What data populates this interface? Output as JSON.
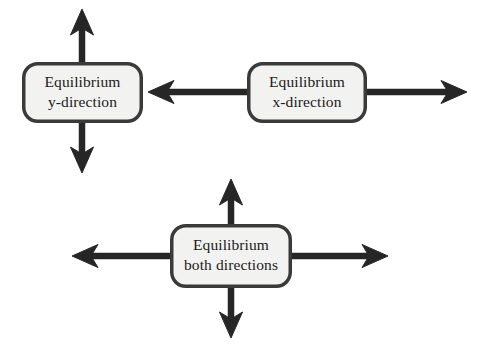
{
  "diagram": {
    "type": "flow-arrow-diagram",
    "background_color": "#ffffff",
    "style": {
      "box_fill": "#f2f2f0",
      "box_border_color": "#3a3a3a",
      "box_border_width": 3.5,
      "box_corner_radius": 14,
      "arrow_color": "#262626",
      "arrow_shaft_width": 6.5,
      "text_color": "#1b1b1b",
      "font_size": 15.5
    },
    "nodes": [
      {
        "id": "equilibrium-y",
        "line1": "Equilibrium",
        "line2": "y-direction",
        "x": 22,
        "y": 62,
        "width": 121,
        "height": 61,
        "arrows": [
          "up",
          "down"
        ]
      },
      {
        "id": "equilibrium-x",
        "line1": "Equilibrium",
        "line2": "x-direction",
        "x": 247,
        "y": 62,
        "width": 120,
        "height": 61,
        "arrows": [
          "left",
          "right"
        ]
      },
      {
        "id": "equilibrium-both",
        "line1": "Equilibrium",
        "line2": "both directions",
        "x": 170,
        "y": 224,
        "width": 122,
        "height": 64,
        "arrows": [
          "up",
          "down",
          "left",
          "right"
        ]
      }
    ],
    "arrows": [
      {
        "id": "arrow-y-up",
        "node": "equilibrium-y",
        "direction": "up",
        "from_x": 82,
        "from_y": 62,
        "to_x": 82,
        "to_y": 9
      },
      {
        "id": "arrow-y-down",
        "node": "equilibrium-y",
        "direction": "down",
        "from_x": 82,
        "from_y": 123,
        "to_x": 82,
        "to_y": 173
      },
      {
        "id": "arrow-x-left",
        "node": "equilibrium-x",
        "direction": "left",
        "from_x": 247,
        "from_y": 92,
        "to_x": 148,
        "to_y": 92
      },
      {
        "id": "arrow-x-right",
        "node": "equilibrium-x",
        "direction": "right",
        "from_x": 367,
        "from_y": 92,
        "to_x": 467,
        "to_y": 92
      },
      {
        "id": "arrow-both-up",
        "node": "equilibrium-both",
        "direction": "up",
        "from_x": 231,
        "from_y": 224,
        "to_x": 231,
        "to_y": 179
      },
      {
        "id": "arrow-both-down",
        "node": "equilibrium-both",
        "direction": "down",
        "from_x": 231,
        "from_y": 288,
        "to_x": 231,
        "to_y": 338
      },
      {
        "id": "arrow-both-left",
        "node": "equilibrium-both",
        "direction": "left",
        "from_x": 170,
        "from_y": 256,
        "to_x": 72,
        "to_y": 256
      },
      {
        "id": "arrow-both-right",
        "node": "equilibrium-both",
        "direction": "right",
        "from_x": 292,
        "from_y": 256,
        "to_x": 388,
        "to_y": 256
      }
    ]
  }
}
